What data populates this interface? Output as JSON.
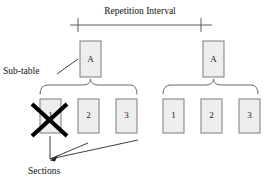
{
  "diagram": {
    "title": "Repetition Interval",
    "labels": {
      "sub_table": "Sub-table",
      "sections": "Sections"
    },
    "subtables": [
      {
        "id": "subtable-left",
        "label": "A"
      },
      {
        "id": "subtable-right",
        "label": "A"
      }
    ],
    "groups": [
      {
        "id": "group-left",
        "sections": [
          {
            "label": "1",
            "crossed_out": true
          },
          {
            "label": "2",
            "crossed_out": false
          },
          {
            "label": "3",
            "crossed_out": false
          }
        ]
      },
      {
        "id": "group-right",
        "sections": [
          {
            "label": "1",
            "crossed_out": false
          },
          {
            "label": "2",
            "crossed_out": false
          },
          {
            "label": "3",
            "crossed_out": false
          }
        ]
      }
    ],
    "colors": {
      "background": "#ffffff",
      "cell_fill": "#eeeeee",
      "cell_stroke": "#7d7d7d",
      "line": "#4a4a4a",
      "text": "#111111",
      "cross_out": "#000000"
    }
  }
}
